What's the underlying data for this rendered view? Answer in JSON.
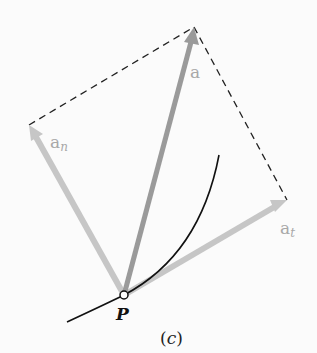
{
  "figure": {
    "caption_open": "(",
    "caption_letter": "c",
    "caption_close": ")",
    "point_label": "P",
    "vectors": {
      "a": {
        "label": "a",
        "subscript": ""
      },
      "an": {
        "label": "a",
        "subscript": "n"
      },
      "at": {
        "label": "a",
        "subscript": "t"
      }
    },
    "colors": {
      "background": "#fbfbfb",
      "vector_a": "#9a9a9a",
      "component_vectors": "#c8c8c8",
      "dashed_lines": "#222222",
      "curve": "#111111",
      "labels": "#a8a8a8"
    }
  }
}
